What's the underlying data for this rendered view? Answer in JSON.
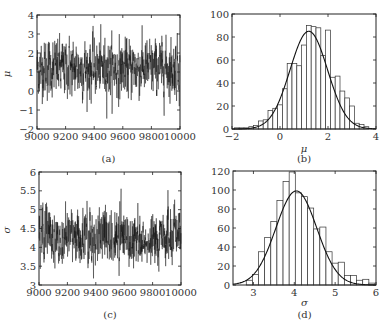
{
  "chart_data": [
    {
      "id": "a",
      "type": "line",
      "caption": "(a)",
      "title": "",
      "xlabel": "",
      "ylabel": "μ",
      "xlim": [
        9000,
        10000
      ],
      "ylim": [
        -2,
        4
      ],
      "xticks": [
        "9000",
        "9200",
        "9400",
        "9600",
        "9800",
        "10000"
      ],
      "yticks": [
        "-2",
        "-1",
        "0",
        "1",
        "2",
        "3",
        "4"
      ],
      "grid": false,
      "description": "MCMC trace of μ over iterations 9000-10000, fluctuating around ~1.2 with range roughly -1.5 to 3.6",
      "series": [
        {
          "name": "μ trace",
          "mean": 1.2,
          "std": 0.75,
          "min": -1.5,
          "max": 3.6
        }
      ]
    },
    {
      "id": "b",
      "type": "bar",
      "caption": "(b)",
      "title": "",
      "xlabel": "μ",
      "ylabel": "",
      "xlim": [
        -2,
        4
      ],
      "ylim": [
        0,
        100
      ],
      "xticks": [
        "-2",
        "0",
        "2",
        "4"
      ],
      "yticks": [
        "0",
        "20",
        "40",
        "60",
        "80",
        "100"
      ],
      "grid": false,
      "bin_width": 0.2,
      "x": [
        -1.8,
        -1.6,
        -1.4,
        -1.2,
        -1.0,
        -0.8,
        -0.6,
        -0.4,
        -0.2,
        0.0,
        0.2,
        0.4,
        0.6,
        0.8,
        1.0,
        1.2,
        1.4,
        1.6,
        1.8,
        2.0,
        2.2,
        2.4,
        2.6,
        2.8,
        3.0,
        3.2,
        3.4,
        3.6
      ],
      "values": [
        1,
        1,
        1,
        2,
        3,
        7,
        8,
        16,
        18,
        21,
        35,
        57,
        57,
        55,
        73,
        90,
        89,
        88,
        64,
        86,
        45,
        46,
        33,
        27,
        20,
        5,
        4,
        2
      ],
      "series": [
        {
          "name": "normal fit",
          "type": "line",
          "mean": 1.2,
          "std": 0.78,
          "peak": 85
        }
      ]
    },
    {
      "id": "c",
      "type": "line",
      "caption": "(c)",
      "title": "",
      "xlabel": "",
      "ylabel": "σ",
      "xlim": [
        9000,
        10000
      ],
      "ylim": [
        3,
        6
      ],
      "xticks": [
        "9000",
        "9200",
        "9400",
        "9600",
        "9800",
        "10000"
      ],
      "yticks": [
        "3",
        "3.5",
        "4",
        "4.5",
        "5",
        "5.5",
        "6"
      ],
      "grid": false,
      "description": "MCMC trace of σ over iterations 9000-10000, fluctuating around ~4.1 with range roughly 3.0 to 6.0",
      "series": [
        {
          "name": "σ trace",
          "mean": 4.1,
          "std": 0.45,
          "min": 3.0,
          "max": 6.0
        }
      ]
    },
    {
      "id": "d",
      "type": "bar",
      "caption": "(d)",
      "title": "",
      "xlabel": "σ",
      "ylabel": "",
      "xlim": [
        2.5,
        6
      ],
      "ylim": [
        0,
        120
      ],
      "xticks": [
        "3",
        "4",
        "5",
        "6"
      ],
      "yticks": [
        "0",
        "20",
        "40",
        "60",
        "80",
        "100",
        "120"
      ],
      "grid": false,
      "bin_width": 0.15,
      "x": [
        2.9,
        3.05,
        3.2,
        3.35,
        3.5,
        3.65,
        3.8,
        3.95,
        4.1,
        4.25,
        4.4,
        4.55,
        4.7,
        4.85,
        5.0,
        5.15,
        5.3,
        5.45,
        5.6,
        5.75,
        5.9
      ],
      "values": [
        5,
        11,
        35,
        50,
        67,
        89,
        109,
        119,
        97,
        93,
        81,
        59,
        61,
        35,
        23,
        24,
        10,
        10,
        5,
        6,
        2
      ],
      "series": [
        {
          "name": "normal fit",
          "type": "line",
          "mean": 4.05,
          "std": 0.5,
          "peak": 99
        }
      ]
    }
  ]
}
